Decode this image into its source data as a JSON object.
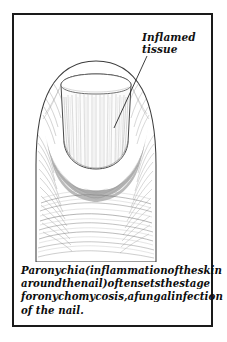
{
  "figure": {
    "frame_color": "#1a1a1a",
    "background_color": "#ffffff"
  },
  "callout": {
    "name": "inflamed-tissue-callout",
    "line_1": "Inflamed",
    "line_2": "tissue",
    "leader_line": {
      "from_x": 133,
      "from_y": 41,
      "to_x": 100,
      "to_y": 113
    }
  },
  "caption": {
    "line_1_words": [
      "Paronychia",
      "(inflammation",
      "of",
      "the",
      "skin"
    ],
    "line_2_words": [
      "around",
      "the",
      "nail)",
      "often",
      "sets",
      "the",
      "stage"
    ],
    "line_3_words": [
      "for",
      "onychomycosis,",
      "a",
      "fungal",
      "infection"
    ],
    "line_4": "of the nail.",
    "full_text": "Paronychia (inflammation of the skin around the nail) often sets the stage for onychomycosis, a fungal infection of the nail."
  },
  "illustration": {
    "subject": "fingertip-with-nail",
    "skin_outline_color": "#3a3a3a",
    "nail_plate_color": "#fdfdfd",
    "inflamed_tissue_color": "#b3b3b3",
    "inflamed_tissue_shadow_color": "#9a9a9a",
    "hatching_color": "#8a8a8a",
    "parts": [
      "nail-plate",
      "nail-free-edge",
      "proximal-nail-fold",
      "lateral-nail-fold",
      "inflamed-periungual-tissue",
      "distal-phalanx-skin",
      "skin-creases"
    ]
  }
}
